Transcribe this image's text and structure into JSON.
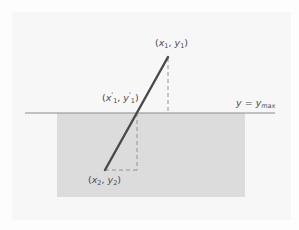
{
  "diagram": {
    "labels": {
      "p1": {
        "x": "x",
        "x_sub": "1",
        "y": "y",
        "y_sub": "1"
      },
      "p1_prime": {
        "x": "x",
        "x_sup": "'",
        "x_sub": "1",
        "y": "y",
        "y_sup": "'",
        "y_sub": "1"
      },
      "p2": {
        "x": "x",
        "x_sub": "2",
        "y": "y",
        "y_sub": "2"
      },
      "boundary": {
        "lhs": "y",
        "eq": "=",
        "rhs": "y",
        "rhs_sub": "max"
      }
    },
    "colors": {
      "background": "#fdfdfd",
      "panel": "#f7f7f7",
      "clip_region": "#dcdcdc",
      "boundary_line": "#8c8c8c",
      "segment": "#4a4a4a",
      "dashes": "#8a8a8a"
    },
    "geometry": {
      "boundary_y": 113,
      "boundary_x_range": [
        25,
        275
      ],
      "clip_rect": {
        "x": 57,
        "y": 113,
        "w": 188,
        "h": 84
      },
      "p1": [
        168,
        57
      ],
      "p1_prime": [
        137,
        113
      ],
      "p2": [
        105,
        170
      ]
    }
  }
}
